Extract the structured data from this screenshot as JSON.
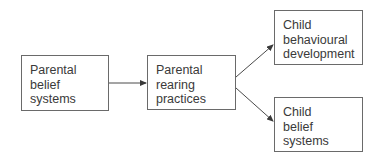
{
  "diagram": {
    "type": "flowchart",
    "direction": "left-to-right",
    "nodes": [
      {
        "id": "parental-belief-systems",
        "lines": [
          "Parental",
          "belief",
          "systems"
        ]
      },
      {
        "id": "parental-rearing-practices",
        "lines": [
          "Parental",
          "rearing",
          "practices"
        ]
      },
      {
        "id": "child-behavioural-development",
        "lines": [
          "Child",
          "behavioural",
          "development"
        ]
      },
      {
        "id": "child-belief-systems",
        "lines": [
          "Child",
          "belief",
          "systems"
        ]
      }
    ],
    "edges": [
      {
        "from": "parental-belief-systems",
        "to": "parental-rearing-practices"
      },
      {
        "from": "parental-rearing-practices",
        "to": "child-behavioural-development"
      },
      {
        "from": "parental-rearing-practices",
        "to": "child-belief-systems"
      }
    ],
    "colors": {
      "line": "#4a4a4a",
      "border": "#6a6a6a",
      "text": "#3a3a3a",
      "background": "#ffffff"
    }
  }
}
